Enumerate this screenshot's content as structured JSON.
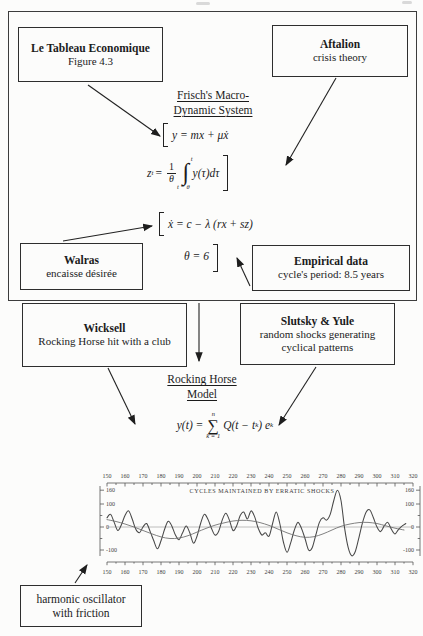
{
  "diagram": {
    "boxes": {
      "tableau": {
        "title": "Le Tableau Economique",
        "subtitle": "Figure 4.3"
      },
      "aftalion": {
        "title": "Aftalion",
        "subtitle": "crisis theory"
      },
      "walras": {
        "title": "Walras",
        "subtitle": "encaisse désirée"
      },
      "empirical": {
        "title": "Empirical data",
        "subtitle": "cycle's period: 8.5 years"
      },
      "wicksell": {
        "title": "Wicksell",
        "subtitle": "Rocking Horse hit with a club"
      },
      "slutsky": {
        "title": "Slutsky & Yule",
        "subtitle": "random shocks generating cyclical patterns"
      },
      "harmonic": {
        "line1": "harmonic oscillator",
        "line2": "with friction"
      }
    },
    "headings": {
      "frisch_line1": "Frisch's Macro-",
      "frisch_line2": "Dynamic System",
      "rocking_line1": "Rocking Horse",
      "rocking_line2": "Model"
    },
    "equations": {
      "consumption": "y = mx + μẋ",
      "carryon_lhs": "z",
      "carryon_sub": "t",
      "equals": "=",
      "frac_num": "1",
      "frac_den": "θ",
      "int_upper": "t",
      "int_sign": "∫",
      "int_lower": "t − θ",
      "integrand": "y(τ)dτ",
      "production": "ẋ = c − λ (rx + sz)",
      "theta": "θ = 6",
      "rocking_lhs": "y(t) =",
      "sum_upper": "n",
      "sum_sign": "∑",
      "sum_lower": "k = 1",
      "rocking_body1": "Q(t − t",
      "rocking_sub1": "k",
      "rocking_body2": ") e",
      "rocking_sub2": "k"
    },
    "arrows": [
      {
        "name": "tableau-to-system",
        "x1": 88,
        "y1": 85,
        "x2": 160,
        "y2": 136
      },
      {
        "name": "aftalion-to-system",
        "x1": 336,
        "y1": 78,
        "x2": 286,
        "y2": 165
      },
      {
        "name": "walras-to-production-eq",
        "x1": 63,
        "y1": 241,
        "x2": 152,
        "y2": 226
      },
      {
        "name": "empirical-to-theta",
        "x1": 250,
        "y1": 286,
        "x2": 237,
        "y2": 258
      },
      {
        "name": "system-to-rocking-horse",
        "x1": 199,
        "y1": 303,
        "x2": 199,
        "y2": 361
      },
      {
        "name": "wicksell-to-model-eq",
        "x1": 108,
        "y1": 368,
        "x2": 135,
        "y2": 424
      },
      {
        "name": "slutsky-to-model-eq",
        "x1": 316,
        "y1": 367,
        "x2": 279,
        "y2": 425
      },
      {
        "name": "harmonic-to-chart",
        "x1": 75,
        "y1": 583,
        "x2": 87,
        "y2": 565
      }
    ]
  },
  "chart_data": {
    "type": "line",
    "title": "CYCLES MAINTAINED BY ERRATIC SHOCKS",
    "xlim": [
      150,
      320
    ],
    "ylim": [
      -130,
      170
    ],
    "x_ticks": [
      150,
      160,
      170,
      180,
      190,
      200,
      210,
      220,
      230,
      240,
      250,
      260,
      270,
      280,
      290,
      300,
      310,
      320
    ],
    "x_minor_step": 5,
    "y_ticks": [
      160,
      100,
      0,
      -100
    ],
    "y_minor_ticks": [
      50,
      -50
    ],
    "zero_line": true,
    "legend_position": "none",
    "grid": false,
    "series": [
      {
        "name": "cycles with erratic shocks",
        "x": [
          150,
          152,
          154,
          156,
          158,
          160,
          162,
          164,
          166,
          168,
          170,
          172,
          174,
          176,
          178,
          180,
          182,
          184,
          186,
          188,
          190,
          192,
          194,
          196,
          198,
          200,
          202,
          204,
          206,
          208,
          210,
          212,
          214,
          216,
          218,
          220,
          222,
          224,
          226,
          228,
          230,
          232,
          234,
          236,
          238,
          240,
          242,
          244,
          246,
          248,
          250,
          252,
          254,
          256,
          258,
          260,
          262,
          264,
          266,
          268,
          270,
          272,
          274,
          276,
          278,
          280,
          282,
          284,
          286,
          288,
          290,
          292,
          294,
          296,
          298,
          300,
          302,
          304,
          306,
          308,
          310,
          312,
          314,
          316
        ],
        "y": [
          40,
          55,
          20,
          -15,
          10,
          50,
          70,
          35,
          -10,
          -25,
          0,
          15,
          -20,
          -60,
          -95,
          -60,
          -10,
          25,
          5,
          -35,
          -55,
          -25,
          5,
          -25,
          -70,
          -40,
          15,
          55,
          35,
          -5,
          -35,
          -20,
          30,
          60,
          30,
          -15,
          5,
          50,
          65,
          35,
          70,
          45,
          -5,
          -35,
          -25,
          -40,
          15,
          65,
          15,
          -65,
          -110,
          -70,
          -15,
          20,
          -5,
          -50,
          -100,
          -90,
          -35,
          20,
          40,
          30,
          55,
          115,
          160,
          115,
          -5,
          -90,
          -125,
          -105,
          -45,
          20,
          65,
          75,
          40,
          0,
          -20,
          5,
          20,
          -10,
          -30,
          -10,
          5,
          15
        ]
      },
      {
        "name": "harmonic oscillator with friction",
        "x": [
          150,
          155,
          160,
          165,
          170,
          175,
          180,
          185,
          190,
          195,
          200,
          205,
          210,
          215,
          220,
          225,
          230,
          235,
          240,
          245,
          250,
          255,
          260,
          265,
          270,
          275,
          280,
          285,
          290,
          295,
          300,
          305,
          310,
          315
        ],
        "y": [
          32,
          24,
          13,
          0,
          -15,
          -30,
          -43,
          -50,
          -48,
          -38,
          -22,
          -6,
          8,
          18,
          26,
          29,
          27,
          19,
          7,
          -9,
          -25,
          -38,
          -45,
          -42,
          -30,
          -13,
          3,
          13,
          19,
          20,
          15,
          5,
          -5,
          -13
        ]
      }
    ]
  }
}
